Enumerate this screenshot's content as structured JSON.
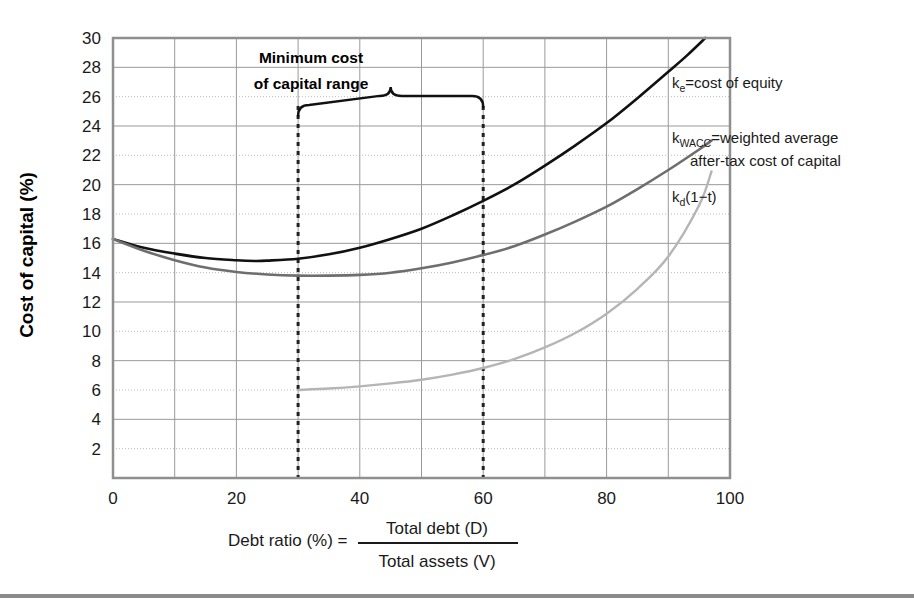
{
  "chart_data": {
    "type": "line",
    "title": "",
    "subtitle": "",
    "xlabel": "Debt ratio (%) = Total debt (D) / Total assets (V)",
    "ylabel": "Cost of capital (%)",
    "xlim": [
      0,
      100
    ],
    "ylim": [
      0,
      30
    ],
    "xticks": [
      "0",
      "20",
      "40",
      "60",
      "80",
      "100"
    ],
    "xtick_values": [
      0,
      20,
      40,
      60,
      80,
      100
    ],
    "yticks": [
      "2",
      "4",
      "6",
      "8",
      "10",
      "12",
      "14",
      "16",
      "18",
      "20",
      "22",
      "24",
      "26",
      "28",
      "30"
    ],
    "ytick_values": [
      2,
      4,
      6,
      8,
      10,
      12,
      14,
      16,
      18,
      20,
      22,
      24,
      26,
      28,
      30
    ],
    "grid": true,
    "grid_major_x_step": 10,
    "grid_major_y_step": 2,
    "legend_position": "inline-right",
    "series": [
      {
        "name": "ke",
        "label": "k_e=cost of equity",
        "color": "#111111",
        "width": 2.6,
        "x": [
          0,
          5,
          10,
          15,
          20,
          23,
          25,
          30,
          35,
          40,
          45,
          50,
          55,
          60,
          65,
          70,
          75,
          80,
          85,
          90,
          93,
          96
        ],
        "values": [
          16.3,
          15.7,
          15.3,
          15.0,
          14.85,
          14.8,
          14.82,
          14.95,
          15.25,
          15.7,
          16.3,
          17.0,
          17.9,
          18.9,
          20.0,
          21.3,
          22.7,
          24.2,
          25.9,
          27.7,
          28.8,
          30.0
        ]
      },
      {
        "name": "kwacc",
        "label": "k_WACC=weighted average after-tax cost of capital",
        "color": "#6e6e6e",
        "width": 2.6,
        "x": [
          0,
          5,
          10,
          15,
          20,
          25,
          30,
          35,
          40,
          45,
          50,
          55,
          60,
          65,
          70,
          75,
          80,
          85,
          90,
          95,
          97
        ],
        "values": [
          16.3,
          15.5,
          14.85,
          14.35,
          14.05,
          13.88,
          13.8,
          13.8,
          13.85,
          14.0,
          14.3,
          14.7,
          15.2,
          15.8,
          16.6,
          17.5,
          18.5,
          19.7,
          21.0,
          22.4,
          23.0
        ]
      },
      {
        "name": "kd1mt",
        "label": "k_d(1−t)",
        "color": "#b5b5b5",
        "width": 2.4,
        "x": [
          30,
          35,
          40,
          45,
          50,
          55,
          60,
          65,
          70,
          75,
          80,
          85,
          90,
          95,
          97
        ],
        "values": [
          6.0,
          6.1,
          6.25,
          6.45,
          6.7,
          7.05,
          7.5,
          8.1,
          8.9,
          9.9,
          11.2,
          12.9,
          15.1,
          18.6,
          20.9
        ]
      }
    ],
    "annotations": [
      {
        "name": "minimum-cost-range",
        "line1": "Minimum cost",
        "line2": "of capital range",
        "x_start": 30,
        "x_end": 60,
        "brace_y": 25.3
      }
    ],
    "reference_lines": [
      {
        "name": "range-start",
        "x": 30,
        "style": "dashed",
        "color": "#222222"
      },
      {
        "name": "range-end",
        "x": 60,
        "style": "dashed",
        "color": "#222222"
      }
    ]
  },
  "labels": {
    "ke_main": "=cost of equity",
    "ke_sym": "k",
    "ke_sub": "e",
    "wacc_sym": "k",
    "wacc_sub": "WACC",
    "wacc_main": "=weighted average",
    "wacc_line2": "after-tax cost of capital",
    "kd_sym": "k",
    "kd_sub": "d",
    "kd_main": "(1−t)",
    "y_axis_title": "Cost of capital (%)",
    "x_axis_prefix": "Debt ratio (%) =",
    "x_axis_numerator": "Total debt (D)",
    "x_axis_denominator": "Total assets (V)",
    "anno_line1": "Minimum cost",
    "anno_line2": "of capital range"
  },
  "colors": {
    "ke": "#111111",
    "kwacc": "#6e6e6e",
    "kd": "#b5b5b5",
    "grid_solid": "#9a9a9a",
    "grid_dotted": "#bdbdbd",
    "axis": "#8f8f8f",
    "text": "#1a1a1a",
    "rule": "#8a8a8a"
  }
}
